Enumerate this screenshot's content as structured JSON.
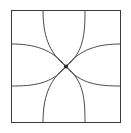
{
  "figure": {
    "canvas": {
      "width": 131,
      "height": 133
    },
    "background_color": "#ffffff",
    "frame": {
      "name": "square-border",
      "left": 11.5,
      "top": 10.5,
      "right": 120.5,
      "bottom": 122.5,
      "stroke_color": "#3a3a3a",
      "stroke_width": 1,
      "fill": "none"
    },
    "center_point": {
      "name": "convergence-point",
      "x": 66,
      "y": 66.5,
      "radius": 2.1,
      "color": "#2b2b2b"
    },
    "curves": {
      "stroke_color": "#4a4a4a",
      "stroke_width": 1,
      "fill": "none",
      "edge_anchors": {
        "top_x": [
          43,
          85
        ],
        "bottom_x": [
          43,
          85
        ],
        "left_y": [
          44,
          86
        ],
        "right_y": [
          44,
          86
        ]
      },
      "paths": [
        {
          "name": "arc-top-left-vertical",
          "from_edge": "top",
          "anchor": [
            43,
            10.5
          ],
          "d": "M 43 10.5 C 43 34 48 52 66 66.5"
        },
        {
          "name": "arc-top-right-vertical",
          "from_edge": "top",
          "anchor": [
            85,
            10.5
          ],
          "d": "M 85 10.5 C 85 34 84 52 66 66.5"
        },
        {
          "name": "arc-bottom-left-vertical",
          "from_edge": "bottom",
          "anchor": [
            43,
            122.5
          ],
          "d": "M 43 122.5 C 43 99 48 81 66 66.5"
        },
        {
          "name": "arc-bottom-right-vertical",
          "from_edge": "bottom",
          "anchor": [
            85,
            122.5
          ],
          "d": "M 85 122.5 C 85 99 84 81 66 66.5"
        },
        {
          "name": "arc-left-top-horizontal",
          "from_edge": "left",
          "anchor": [
            11.5,
            44
          ],
          "d": "M 11.5 44 C 34 44 52 49 66 66.5"
        },
        {
          "name": "arc-left-bottom-horizontal",
          "from_edge": "left",
          "anchor": [
            11.5,
            86
          ],
          "d": "M 11.5 86 C 34 86 52 84 66 66.5"
        },
        {
          "name": "arc-right-top-horizontal",
          "from_edge": "right",
          "anchor": [
            120.5,
            44
          ],
          "d": "M 120.5 44 C 98 44 80 49 66 66.5"
        },
        {
          "name": "arc-right-bottom-horizontal",
          "from_edge": "right",
          "anchor": [
            120.5,
            86
          ],
          "d": "M 120.5 86 C 98 86 80 84 66 66.5"
        }
      ]
    }
  }
}
